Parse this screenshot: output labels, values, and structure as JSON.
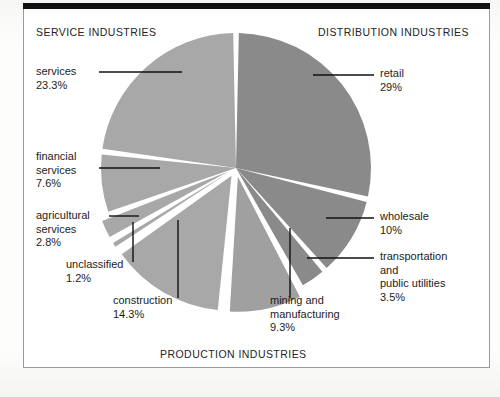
{
  "figure": {
    "sections": {
      "service": "SERVICE INDUSTRIES",
      "distribution": "DISTRIBUTION INDUSTRIES",
      "production": "PRODUCTION INDUSTRIES"
    },
    "colors": {
      "distribution_slice": "#8a8a8a",
      "service_production_slice": "#a8a8a8",
      "leader_line": "#111111",
      "frame": "#9a9a9a",
      "top_bar": "#111111",
      "background": "#ffffff"
    }
  },
  "labels": {
    "services": {
      "name": "services",
      "pct": "23.3%"
    },
    "financial": {
      "name": "financial\nservices",
      "name_line1": "financial",
      "name_line2": "services",
      "pct": "7.6%"
    },
    "agricultural": {
      "name_line1": "agricultural",
      "name_line2": "services",
      "pct": "2.8%"
    },
    "unclassified": {
      "name": "unclassified",
      "pct": "1.2%"
    },
    "construction": {
      "name": "construction",
      "pct": "14.3%"
    },
    "mining": {
      "name_line1": "mining and",
      "name_line2": "manufacturing",
      "pct": "9.3%"
    },
    "retail": {
      "name": "retail",
      "pct": "29%"
    },
    "wholesale": {
      "name": "wholesale",
      "pct": "10%"
    },
    "transport": {
      "name_line1": "transportation",
      "name_line2": "and",
      "name_line3": "public utilities",
      "pct": "3.5%"
    }
  },
  "chart_data": {
    "type": "pie",
    "title": "",
    "legend": "none",
    "center": [
      236,
      168
    ],
    "radius": 135,
    "start_angle_deg": 0,
    "direction": "clockwise",
    "unit": "percent",
    "categories": [
      "retail",
      "wholesale",
      "transportation and public utilities",
      "mining and manufacturing",
      "construction",
      "unclassified",
      "agricultural services",
      "financial services",
      "services"
    ],
    "values": [
      29,
      10,
      3.5,
      9.3,
      14.3,
      1.2,
      2.8,
      7.6,
      23.3
    ],
    "groups": [
      {
        "name": "DISTRIBUTION INDUSTRIES",
        "members": [
          "retail",
          "wholesale",
          "transportation and public utilities"
        ],
        "total": 42.5,
        "color": "#8a8a8a"
      },
      {
        "name": "PRODUCTION INDUSTRIES",
        "members": [
          "mining and manufacturing",
          "construction"
        ],
        "total": 23.6,
        "color": "#a8a8a8"
      },
      {
        "name": "SERVICE INDUSTRIES",
        "members": [
          "unclassified",
          "agricultural services",
          "financial services",
          "services"
        ],
        "total": 34.9,
        "color": "#a8a8a8"
      }
    ],
    "exploded": [
      "mining and manufacturing",
      "construction",
      "unclassified",
      "agricultural services"
    ],
    "slices": [
      {
        "label": "retail",
        "value": 29,
        "color": "#8a8a8a",
        "exploded": false
      },
      {
        "label": "wholesale",
        "value": 10,
        "color": "#8a8a8a",
        "exploded": false
      },
      {
        "label": "transportation and public utilities",
        "value": 3.5,
        "color": "#8a8a8a",
        "exploded": false
      },
      {
        "label": "mining and manufacturing",
        "value": 9.3,
        "color": "#a0a0a0",
        "exploded": true
      },
      {
        "label": "construction",
        "value": 14.3,
        "color": "#a8a8a8",
        "exploded": true
      },
      {
        "label": "unclassified",
        "value": 1.2,
        "color": "#a8a8a8",
        "exploded": true
      },
      {
        "label": "agricultural services",
        "value": 2.8,
        "color": "#a8a8a8",
        "exploded": true
      },
      {
        "label": "financial services",
        "value": 7.6,
        "color": "#a8a8a8",
        "exploded": false
      },
      {
        "label": "services",
        "value": 23.3,
        "color": "#a8a8a8",
        "exploded": false
      }
    ]
  }
}
